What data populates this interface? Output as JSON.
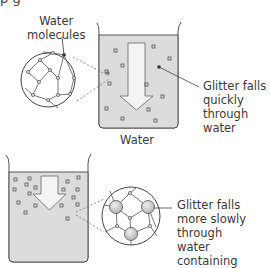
{
  "diagram": {
    "clipped_heading": "p                             g",
    "top": {
      "callout_label": "Water\nmolecules",
      "side_label": "Glitter falls\nquickly\nthrough\nwater",
      "caption": "Water"
    },
    "bottom": {
      "side_label": "Glitter falls\nmore slowly\nthrough\nwater\ncontaining"
    },
    "colors": {
      "liquid": "#dcdcdc",
      "outline": "#555555",
      "arrow_fill": "#f4f4f4",
      "molecule": "#c8c8c8"
    }
  }
}
